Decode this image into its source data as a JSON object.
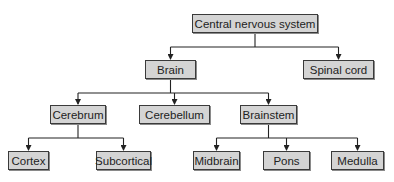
{
  "diagram": {
    "type": "hierarchy",
    "colors": {
      "box_fill": "#d4d4d4",
      "box_border": "#3a3a3a",
      "line": "#222222"
    },
    "nodes": {
      "cns": {
        "label": "Central nervous system",
        "x": 192,
        "y": 14,
        "w": 126,
        "h": 19
      },
      "brain": {
        "label": "Brain",
        "x": 145,
        "y": 60,
        "w": 51,
        "h": 19
      },
      "spinal_cord": {
        "label": "Spinal cord",
        "x": 303,
        "y": 60,
        "w": 71,
        "h": 19
      },
      "cerebrum": {
        "label": "Cerebrum",
        "x": 50,
        "y": 105,
        "w": 56,
        "h": 19
      },
      "cerebellum": {
        "label": "Cerebellum",
        "x": 139,
        "y": 105,
        "w": 71,
        "h": 19
      },
      "brainstem": {
        "label": "Brainstem",
        "x": 240,
        "y": 105,
        "w": 57,
        "h": 19
      },
      "cortex": {
        "label": "Cortex",
        "x": 8,
        "y": 151,
        "w": 41,
        "h": 19
      },
      "subcortical": {
        "label": "Subcortical",
        "x": 96,
        "y": 151,
        "w": 55,
        "h": 19
      },
      "midbrain": {
        "label": "Midbrain",
        "x": 193,
        "y": 151,
        "w": 47,
        "h": 19
      },
      "pons": {
        "label": "Pons",
        "x": 263,
        "y": 151,
        "w": 47,
        "h": 19
      },
      "medulla": {
        "label": "Medulla",
        "x": 331,
        "y": 151,
        "w": 53,
        "h": 19
      }
    },
    "edges": [
      [
        "cns",
        "brain"
      ],
      [
        "cns",
        "spinal_cord"
      ],
      [
        "brain",
        "cerebrum"
      ],
      [
        "brain",
        "cerebellum"
      ],
      [
        "brain",
        "brainstem"
      ],
      [
        "cerebrum",
        "cortex"
      ],
      [
        "cerebrum",
        "subcortical"
      ],
      [
        "brainstem",
        "midbrain"
      ],
      [
        "brainstem",
        "pons"
      ],
      [
        "brainstem",
        "medulla"
      ]
    ]
  }
}
